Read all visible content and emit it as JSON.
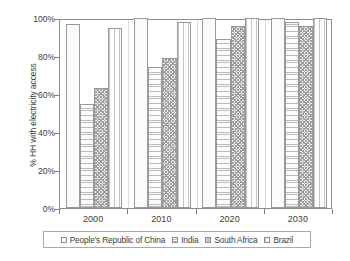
{
  "chart_data": {
    "type": "bar",
    "title": "",
    "xlabel": "",
    "ylabel": "% HH with electricity access",
    "categories": [
      "2000",
      "2010",
      "2020",
      "2030"
    ],
    "ylim": [
      0,
      100
    ],
    "yticks": [
      0,
      20,
      40,
      60,
      80,
      100
    ],
    "ytick_labels": [
      "0%",
      "20%",
      "40%",
      "60%",
      "80%",
      "100%"
    ],
    "grid": false,
    "legend_position": "bottom",
    "series": [
      {
        "name": "People's Republic of China",
        "pattern": "fine-crosshatch",
        "values": [
          97,
          100,
          100,
          100
        ]
      },
      {
        "name": "India",
        "pattern": "horizontal-lines",
        "values": [
          55,
          74,
          89,
          98
        ]
      },
      {
        "name": "South Africa",
        "pattern": "dark-checker",
        "values": [
          63,
          79,
          96,
          96
        ]
      },
      {
        "name": "Brazil",
        "pattern": "vertical-lines",
        "values": [
          95,
          98,
          100,
          100
        ]
      }
    ]
  },
  "axes": {
    "y_title": "% HH with electricity access"
  },
  "colors": {
    "frame": "#8d8d8d",
    "text": "#3c3c3c",
    "gridline": "#d8d8d8",
    "background": "#ffffff"
  }
}
